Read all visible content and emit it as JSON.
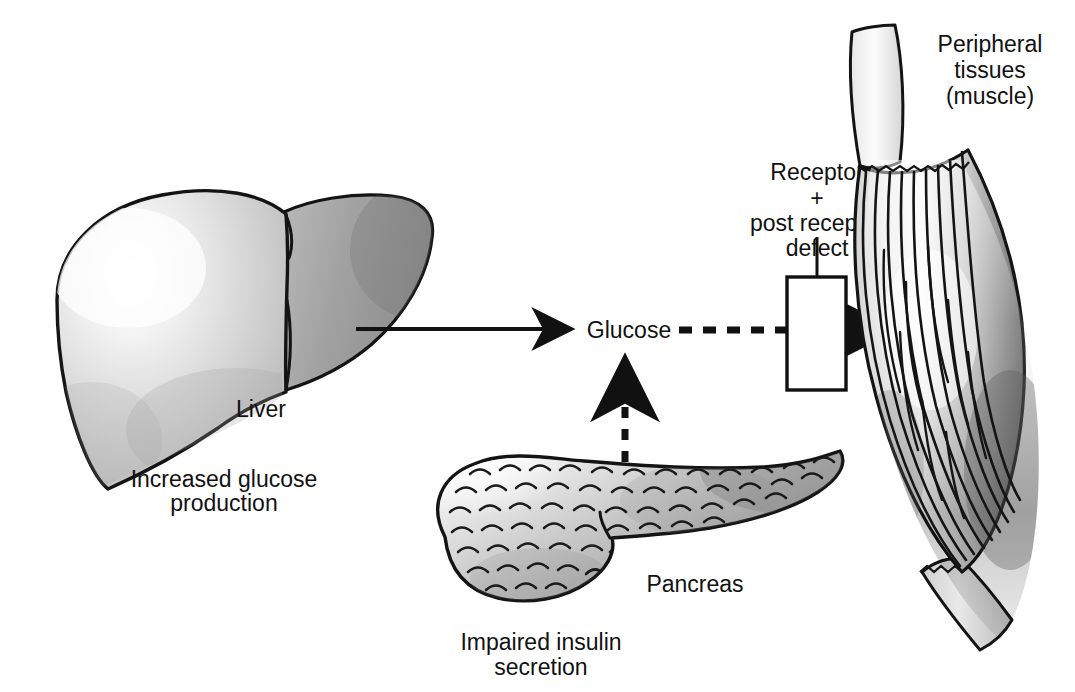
{
  "figure": {
    "kind": "medical-illustration-flow-diagram",
    "background_color": "#ffffff",
    "line_color": "#111111"
  },
  "organs": [
    {
      "id": "liver",
      "label": "Liver",
      "caption_line1": "Increased glucose",
      "caption_line2": "production",
      "fill_light": "#fdfdfd",
      "fill_mid": "#c9c9c9",
      "fill_dark": "#949494"
    },
    {
      "id": "pancreas",
      "label": "Pancreas",
      "caption_line1": "Impaired insulin",
      "caption_line2": "secretion",
      "fill_light": "#f2f2f2",
      "fill_mid": "#c2c2c2",
      "fill_dark": "#8e8e8e"
    },
    {
      "id": "muscle",
      "label_line1": "Peripheral",
      "label_line2": "tissues",
      "label_line3": "(muscle)",
      "fill_light": "#fbfbfb",
      "fill_mid": "#b8b8b8",
      "fill_dark": "#6f6f6f"
    }
  ],
  "nodes": {
    "glucose": {
      "label": "Glucose"
    },
    "receptor_box": {
      "line1": "Receptor",
      "line2": "+",
      "line3": "post receptor",
      "line4": "defect",
      "stroke_color": "#111111",
      "fill_color": "#ffffff"
    }
  },
  "arrows": [
    {
      "id": "liver-to-glucose",
      "style": "solid",
      "from": "liver",
      "to": "glucose",
      "direction": "right"
    },
    {
      "id": "pancreas-to-glucose",
      "style": "dashed",
      "from": "pancreas",
      "to": "glucose",
      "direction": "up"
    },
    {
      "id": "glucose-to-muscle",
      "style": "dashed",
      "from": "glucose",
      "to": "muscle",
      "direction": "right"
    }
  ]
}
